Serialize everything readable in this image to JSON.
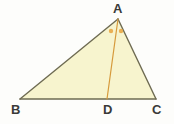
{
  "figure": {
    "type": "geometry-diagram",
    "colors": {
      "background": "#fdfdfb",
      "triangle_fill": "#f7f4ce",
      "triangle_stroke": "#6e6b52",
      "cevian_stroke": "#d69a3c",
      "angle_marker": "#e8a33d",
      "label_text": "#3a3a38"
    },
    "vertices": [
      {
        "name": "A",
        "label": "A",
        "x": 118,
        "y": 19
      },
      {
        "name": "B",
        "label": "B",
        "x": 20,
        "y": 99
      },
      {
        "name": "C",
        "label": "C",
        "x": 156,
        "y": 99
      },
      {
        "name": "D",
        "label": "D",
        "x": 107,
        "y": 99
      }
    ],
    "segments": [
      {
        "name": "AB",
        "from": "A",
        "to": "B",
        "color": "#6e6b52",
        "width": 1.4
      },
      {
        "name": "BC",
        "from": "B",
        "to": "C",
        "color": "#6e6b52",
        "width": 1.4
      },
      {
        "name": "CA",
        "from": "C",
        "to": "A",
        "color": "#6e6b52",
        "width": 1.4
      },
      {
        "name": "AD",
        "from": "A",
        "to": "D",
        "color": "#d69a3c",
        "width": 1.2
      }
    ],
    "angle_markers": [
      {
        "name": "angle-BAD-marker",
        "x": 111,
        "y": 31,
        "r": 2.2,
        "color": "#e8a33d"
      },
      {
        "name": "angle-DAC-marker",
        "x": 121,
        "y": 31,
        "r": 2.2,
        "color": "#e8a33d"
      }
    ],
    "labels": {
      "A": "A",
      "B": "B",
      "C": "C",
      "D": "D"
    }
  }
}
